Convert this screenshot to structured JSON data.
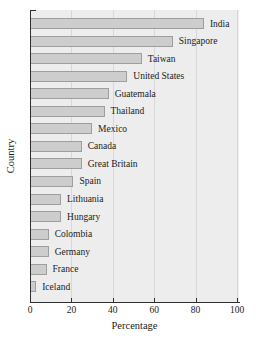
{
  "chart_data": {
    "type": "bar",
    "orientation": "horizontal",
    "title": "",
    "xlabel": "Percentage",
    "ylabel": "Country",
    "categories": [
      "India",
      "Singapore",
      "Taiwan",
      "United States",
      "Guatemala",
      "Thailand",
      "Mexico",
      "Canada",
      "Great Britain",
      "Spain",
      "Lithuania",
      "Hungary",
      "Colombia",
      "Germany",
      "France",
      "Iceland"
    ],
    "values": [
      84,
      69,
      54,
      47,
      38,
      36,
      30,
      25,
      25,
      21,
      15,
      15,
      9,
      9,
      8,
      3
    ],
    "xlim": [
      0,
      100
    ],
    "xticks": [
      0,
      20,
      40,
      60,
      80,
      100
    ],
    "grid": true,
    "legend": "none",
    "bar_fill": "#cdcdcd",
    "bar_border": "#9e9e9e",
    "plot_background": "#ededed",
    "gridline_color": "#d8d8d8",
    "axis_color": "#2f2f2f",
    "label_position": "right-of-bar"
  }
}
